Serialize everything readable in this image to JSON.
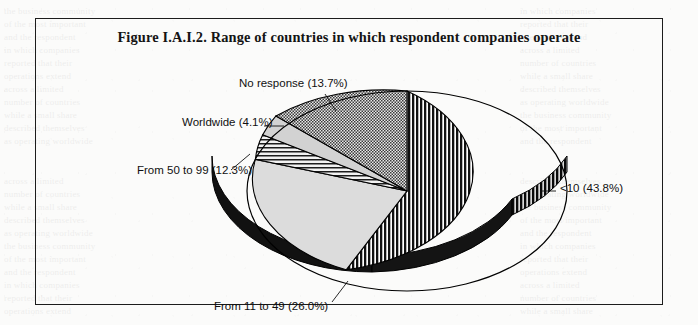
{
  "figure": {
    "title": "Figure I.A.I.2.  Range of countries in which respondent companies operate"
  },
  "chart_data": {
    "type": "pie",
    "title": "Figure I.A.I.2.  Range of countries in which respondent companies operate",
    "xlabel": "",
    "ylabel": "",
    "legend_position": "none",
    "labels_position": "outside-with-leaders",
    "three_d": true,
    "start_angle_deg": 0,
    "direction": "clockwise",
    "categories": [
      "<10",
      "From 11 to 49",
      "From 50 to 99",
      "Worldwide",
      "No response"
    ],
    "values": [
      43.8,
      26.0,
      12.3,
      4.1,
      13.7
    ],
    "unit": "%",
    "slice_labels": [
      "<10 (43.8%)",
      "From 11 to 49 (26.0%)",
      "From 50 to 99 (12.3%)",
      "Worldwide (4.1%)",
      "No response (13.7%)"
    ],
    "slices": [
      {
        "name": "<10",
        "label": "<10 (43.8%)",
        "value": 43.8,
        "pattern": "vertical-stripes",
        "color": "#1a1a1a"
      },
      {
        "name": "From 11 to 49",
        "label": "From 11 to 49 (26.0%)",
        "value": 26.0,
        "pattern": "solid-light",
        "color": "#d8d8d8"
      },
      {
        "name": "From 50 to 99",
        "label": "From 50 to 99 (12.3%)",
        "value": 12.3,
        "pattern": "horizontal-stripes",
        "color": "#2a2a2a"
      },
      {
        "name": "Worldwide",
        "label": "Worldwide (4.1%)",
        "value": 4.1,
        "pattern": "solid-light",
        "color": "#d0d0d0"
      },
      {
        "name": "No response",
        "label": "No response (13.7%)",
        "value": 13.7,
        "pattern": "checker-50-gray",
        "color": "#6e6e6e"
      }
    ]
  },
  "background_ghost_text": {
    "lines": [
      "the business community",
      "of the most important",
      "and the respondent",
      "in which companies",
      "reported that their",
      "operations extend",
      "across a limited",
      "number of countries",
      "while a small share",
      "described themselves",
      "as operating worldwide"
    ]
  }
}
